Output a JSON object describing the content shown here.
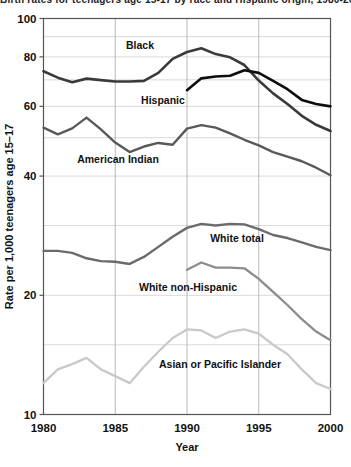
{
  "title_clipped": "Birth rates for teenagers age 15-17 by race and Hispanic origin, 1980-2000",
  "axes": {
    "y_title": "Rate per 1,000 teenagers age 15–17",
    "x_title": "Year",
    "y_ticks": [
      "100",
      "80",
      "60",
      "40",
      "20",
      "10"
    ],
    "x_ticks": [
      "1980",
      "1985",
      "1990",
      "1995",
      "2000"
    ],
    "y_scale": "log",
    "y_range": [
      10,
      100
    ],
    "x_range": [
      1980,
      2000
    ]
  },
  "colors": {
    "black_series": "#3a3a3a",
    "hispanic_series": "#0d0d0d",
    "american_indian_series": "#595959",
    "white_total_series": "#6b6b6b",
    "white_non_hispanic_series": "#8c8c8c",
    "asian_pacific_islander_series": "#c9c9c9",
    "grid": "#d9d9d9",
    "frame": "#555555",
    "text": "#111111",
    "background": "#ffffff"
  },
  "labels": {
    "black": "Black",
    "hispanic": "Hispanic",
    "american_indian": "American Indian",
    "white_total": "White total",
    "white_non_hispanic": "White non-Hispanic",
    "asian_pacific_islander": "Asian or Pacific Islander"
  },
  "chart_data": {
    "type": "line",
    "title": "Birth rates for teenagers age 15-17 by race and Hispanic origin, 1980-2000",
    "xlabel": "Year",
    "ylabel": "Rate per 1,000 teenagers age 15–17",
    "yscale": "log",
    "ylim": [
      10,
      100
    ],
    "xlim": [
      1980,
      2000
    ],
    "grid": true,
    "legend": "inline-labels",
    "x": [
      1980,
      1981,
      1982,
      1983,
      1984,
      1985,
      1986,
      1987,
      1988,
      1989,
      1990,
      1991,
      1992,
      1993,
      1994,
      1995,
      1996,
      1997,
      1998,
      1999,
      2000
    ],
    "series": [
      {
        "name": "Black",
        "color": "#3a3a3a",
        "x": [
          1980,
          1981,
          1982,
          1983,
          1984,
          1985,
          1986,
          1987,
          1988,
          1989,
          1990,
          1991,
          1992,
          1993,
          1994,
          1995,
          1996,
          1997,
          1998,
          1999,
          2000
        ],
        "values": [
          73.6,
          70.9,
          69.0,
          70.5,
          69.9,
          69.3,
          69.3,
          69.6,
          72.9,
          79.1,
          82.3,
          84.1,
          81.3,
          79.8,
          76.3,
          69.7,
          64.7,
          60.8,
          56.8,
          53.9,
          52.0
        ]
      },
      {
        "name": "Hispanic",
        "color": "#0d0d0d",
        "x": [
          1990,
          1991,
          1992,
          1993,
          1994,
          1995,
          1996,
          1997,
          1998,
          1999,
          2000
        ],
        "values": [
          65.9,
          70.6,
          71.4,
          71.7,
          74.0,
          72.9,
          69.6,
          66.3,
          62.3,
          60.8,
          60.0
        ]
      },
      {
        "name": "American Indian",
        "color": "#595959",
        "x": [
          1980,
          1981,
          1982,
          1983,
          1984,
          1985,
          1986,
          1987,
          1988,
          1989,
          1990,
          1991,
          1992,
          1993,
          1994,
          1995,
          1996,
          1997,
          1998,
          1999,
          2000
        ],
        "values": [
          53.0,
          51.0,
          52.8,
          56.2,
          52.5,
          48.6,
          46.0,
          47.5,
          48.5,
          48.0,
          52.7,
          53.8,
          53.0,
          51.3,
          49.4,
          47.8,
          46.0,
          44.8,
          43.6,
          42.0,
          40.2
        ]
      },
      {
        "name": "White total",
        "color": "#6b6b6b",
        "x": [
          1980,
          1981,
          1982,
          1983,
          1984,
          1985,
          1986,
          1987,
          1988,
          1989,
          1990,
          1991,
          1992,
          1993,
          1994,
          1995,
          1996,
          1997,
          1998,
          1999,
          2000
        ],
        "values": [
          25.9,
          25.9,
          25.6,
          24.8,
          24.4,
          24.3,
          24.0,
          25.0,
          26.5,
          28.1,
          29.6,
          30.3,
          30.0,
          30.3,
          30.2,
          29.4,
          28.4,
          27.9,
          27.2,
          26.5,
          26.0
        ]
      },
      {
        "name": "White non-Hispanic",
        "color": "#8c8c8c",
        "x": [
          1990,
          1991,
          1992,
          1993,
          1994,
          1995,
          1996,
          1997,
          1998,
          1999,
          2000
        ],
        "values": [
          23.2,
          24.2,
          23.5,
          23.5,
          23.4,
          22.0,
          20.4,
          18.9,
          17.4,
          16.2,
          15.4
        ]
      },
      {
        "name": "Asian or Pacific Islander",
        "color": "#c9c9c9",
        "x": [
          1980,
          1981,
          1982,
          1983,
          1984,
          1985,
          1986,
          1987,
          1988,
          1989,
          1990,
          1991,
          1992,
          1993,
          1994,
          1995,
          1996,
          1997,
          1998,
          1999,
          2000
        ],
        "values": [
          12.0,
          13.0,
          13.4,
          13.9,
          13.0,
          12.5,
          12.0,
          13.2,
          14.4,
          15.6,
          16.4,
          16.3,
          15.6,
          16.2,
          16.4,
          16.0,
          15.0,
          14.2,
          13.0,
          12.0,
          11.6
        ]
      }
    ]
  }
}
